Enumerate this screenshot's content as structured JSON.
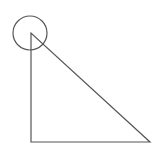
{
  "diagram": {
    "width": 166,
    "height": 158,
    "background": "#ffffff",
    "stroke_color": "#555555",
    "stroke_width": 1.2,
    "circle": {
      "cx": 30,
      "cy": 33,
      "r": 17
    },
    "triangle": {
      "type": "right-triangle",
      "vertices": [
        [
          31,
          33
        ],
        [
          31,
          142
        ],
        [
          150,
          142
        ]
      ]
    }
  }
}
